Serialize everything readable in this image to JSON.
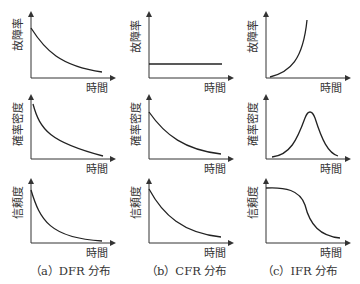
{
  "chart_data": [
    {
      "type": "line",
      "column": "a",
      "caption": "（a）DFR 分布",
      "panels": [
        {
          "ylabel": "故障率",
          "xlabel": "時間",
          "shape": "decreasing-convex",
          "description": "failure rate decreases over time"
        },
        {
          "ylabel": "確率密度",
          "xlabel": "時間",
          "shape": "decreasing-steep",
          "description": "probability density decreases steeply"
        },
        {
          "ylabel": "信頼度",
          "xlabel": "時間",
          "shape": "decreasing-steep",
          "description": "reliability decreases steeply"
        }
      ]
    },
    {
      "type": "line",
      "column": "b",
      "caption": "（b）CFR 分布",
      "panels": [
        {
          "ylabel": "故障率",
          "xlabel": "時間",
          "shape": "constant",
          "description": "failure rate constant over time"
        },
        {
          "ylabel": "確率密度",
          "xlabel": "時間",
          "shape": "exponential-decay",
          "description": "exponential density"
        },
        {
          "ylabel": "信頼度",
          "xlabel": "時間",
          "shape": "exponential-decay",
          "description": "exponential reliability"
        }
      ]
    },
    {
      "type": "line",
      "column": "c",
      "caption": "（c）IFR 分布",
      "panels": [
        {
          "ylabel": "故障率",
          "xlabel": "時間",
          "shape": "increasing-convex",
          "description": "failure rate increases over time"
        },
        {
          "ylabel": "確率密度",
          "xlabel": "時間",
          "shape": "bell",
          "description": "probability density bell-shaped peak"
        },
        {
          "ylabel": "信頼度",
          "xlabel": "時間",
          "shape": "reverse-sigmoid",
          "description": "reliability stays high then drops"
        }
      ]
    }
  ],
  "labels": {
    "failure_rate": "故障率",
    "density": "確率密度",
    "reliability": "信頼度",
    "time": "時間"
  },
  "captions": {
    "a": "（a）DFR 分布",
    "b": "（b）CFR 分布",
    "c": "（c）IFR 分布"
  }
}
